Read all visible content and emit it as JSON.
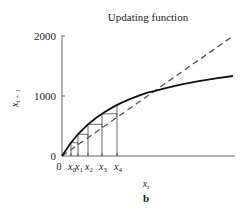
{
  "chart_data": {
    "type": "line",
    "title": "Updating function",
    "xlabel": "x_t",
    "ylabel": "x_{t+1}",
    "panel_label": "b",
    "xlim": [
      0,
      2000
    ],
    "ylim": [
      0,
      2000
    ],
    "yticks": [
      0,
      1000,
      2000
    ],
    "ytick_labels": [
      "0",
      "1000",
      "2000"
    ],
    "xtick_labels": [
      "0",
      "x0",
      "x1",
      "x2",
      "x3",
      "x4"
    ],
    "xtick_values": [
      0,
      105,
      187,
      304,
      468,
      643
    ],
    "grid": false,
    "legend": null,
    "series": [
      {
        "name": "updating function",
        "style": "solid",
        "color": "#111111",
        "x": [
          0,
          100,
          200,
          300,
          400,
          500,
          600,
          700,
          800,
          900,
          1000,
          1080,
          1200,
          1400,
          1600,
          1800,
          2000
        ],
        "values": [
          0,
          214,
          384,
          523,
          638,
          735,
          818,
          890,
          952,
          1006,
          1055,
          1080,
          1127,
          1193,
          1247,
          1294,
          1333
        ]
      },
      {
        "name": "x_{t+1} = x_t",
        "style": "dashed",
        "color": "#555555",
        "x": [
          0,
          2000
        ],
        "values": [
          0,
          2000
        ]
      }
    ],
    "equilibrium": {
      "x": 1080,
      "y": 1080
    },
    "cobweb_x": [
      105,
      187,
      304,
      468,
      643
    ]
  }
}
